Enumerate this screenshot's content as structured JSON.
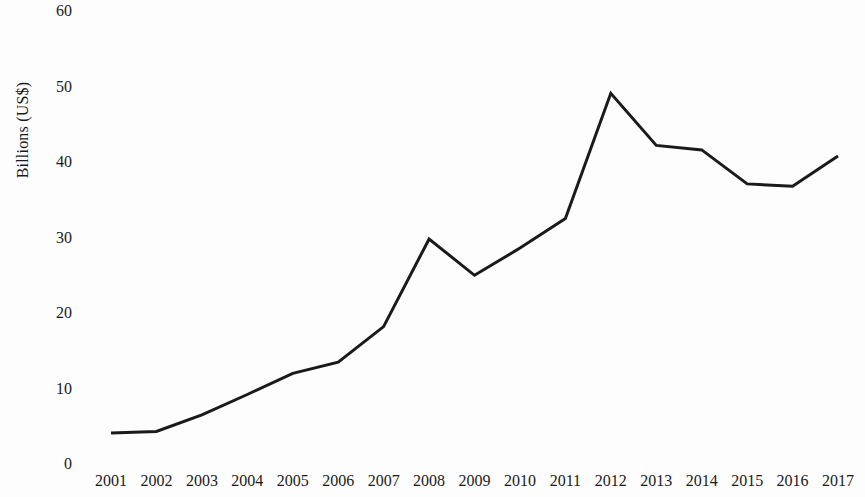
{
  "chart_data": {
    "type": "line",
    "title": "",
    "subtitle": "",
    "xlabel": "",
    "ylabel": "Billions (US$)",
    "categories": [
      "2001",
      "2002",
      "2003",
      "2004",
      "2005",
      "2006",
      "2007",
      "2008",
      "2009",
      "2010",
      "2011",
      "2012",
      "2013",
      "2014",
      "2015",
      "2016",
      "2017"
    ],
    "values": [
      4.1,
      4.3,
      6.5,
      9.2,
      12.0,
      13.5,
      18.2,
      29.8,
      25.0,
      28.6,
      32.5,
      49.1,
      42.2,
      41.6,
      37.1,
      36.8,
      40.8
    ],
    "series": [
      {
        "name": "Billions (US$)",
        "values": [
          4.1,
          4.3,
          6.5,
          9.2,
          12.0,
          13.5,
          18.2,
          29.8,
          25.0,
          28.6,
          32.5,
          49.1,
          42.2,
          41.6,
          37.1,
          36.8,
          40.8
        ],
        "color": "#1a1a1a"
      }
    ],
    "ylim": [
      0,
      60
    ],
    "yticks": [
      0,
      10,
      20,
      30,
      40,
      50,
      60
    ],
    "ytick_labels": [
      "0",
      "10",
      "20",
      "30",
      "40",
      "50",
      "60"
    ],
    "xtick_labels": [
      "2001",
      "2002",
      "2003",
      "2004",
      "2005",
      "2006",
      "2007",
      "2008",
      "2009",
      "2010",
      "2011",
      "2012",
      "2013",
      "2014",
      "2015",
      "2016",
      "2017"
    ],
    "grid": false,
    "legend": false,
    "legend_position": "none",
    "line_color": "#1a1a1a",
    "line_width": 3,
    "markers": false,
    "background_color": "#fdfdfd"
  },
  "axis": {
    "y_title": "Billions (US$)"
  }
}
